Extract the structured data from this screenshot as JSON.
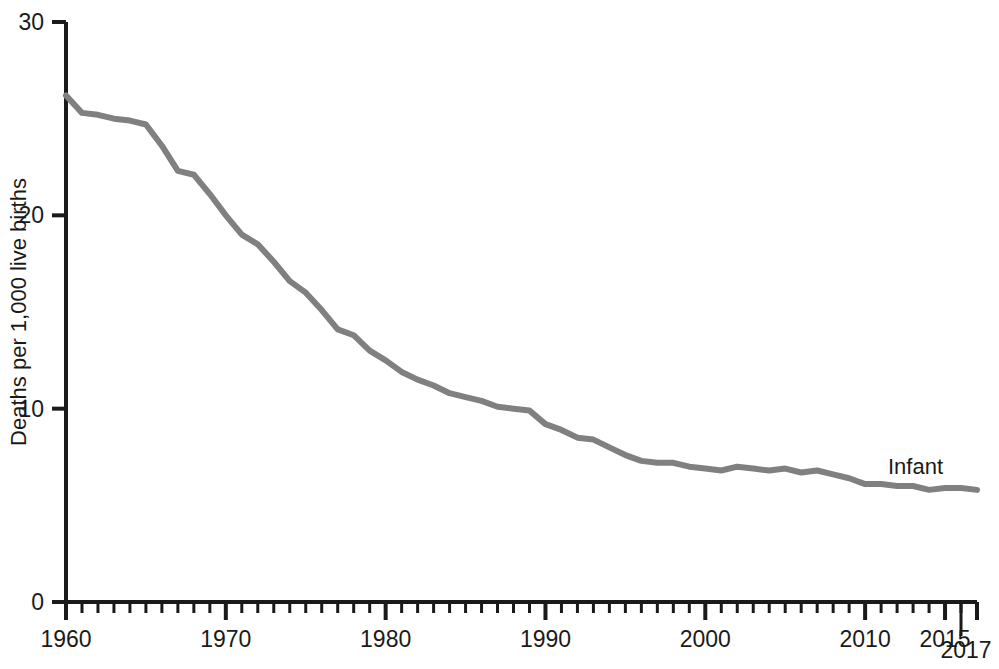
{
  "chart_data": {
    "type": "line",
    "title": "",
    "subtitle": "",
    "xlabel": "",
    "ylabel": "Deaths per 1,000 live births",
    "xlim": [
      1960,
      2017
    ],
    "ylim": [
      0,
      30
    ],
    "grid": false,
    "legend_position": "inline-right-end",
    "y_ticks": [
      0,
      10,
      20,
      30
    ],
    "y_tick_labels": [
      "0",
      "10",
      "20",
      "30"
    ],
    "x_ticks": [
      1960,
      1970,
      1980,
      1990,
      2000,
      2010,
      2015,
      2017
    ],
    "x_tick_labels": [
      "1960",
      "1970",
      "1980",
      "1990",
      "2000",
      "2010",
      "2015",
      "2017"
    ],
    "x_minor_tick_interval": 1,
    "annotations": [
      {
        "text": "2017",
        "kind": "end-year-callout",
        "x": 2017
      }
    ],
    "series": [
      {
        "name": "Infant",
        "label": "Infant",
        "color": "#808080",
        "line_width": 6,
        "x": [
          1960,
          1961,
          1962,
          1963,
          1964,
          1965,
          1966,
          1967,
          1968,
          1969,
          1970,
          1971,
          1972,
          1973,
          1974,
          1975,
          1976,
          1977,
          1978,
          1979,
          1980,
          1981,
          1982,
          1983,
          1984,
          1985,
          1986,
          1987,
          1988,
          1989,
          1990,
          1991,
          1992,
          1993,
          1994,
          1995,
          1996,
          1997,
          1998,
          1999,
          2000,
          2001,
          2002,
          2003,
          2004,
          2005,
          2006,
          2007,
          2008,
          2009,
          2010,
          2011,
          2012,
          2013,
          2014,
          2015,
          2016,
          2017
        ],
        "values": [
          26.2,
          25.3,
          25.2,
          25.0,
          24.9,
          24.7,
          23.6,
          22.3,
          22.1,
          21.1,
          20.0,
          19.0,
          18.5,
          17.6,
          16.6,
          16.0,
          15.1,
          14.1,
          13.8,
          13.0,
          12.5,
          11.9,
          11.5,
          11.2,
          10.8,
          10.6,
          10.4,
          10.1,
          10.0,
          9.9,
          9.2,
          8.9,
          8.5,
          8.4,
          8.0,
          7.6,
          7.3,
          7.2,
          7.2,
          7.0,
          6.9,
          6.8,
          7.0,
          6.9,
          6.8,
          6.9,
          6.7,
          6.8,
          6.6,
          6.4,
          6.1,
          6.1,
          6.0,
          6.0,
          5.8,
          5.9,
          5.9,
          5.8
        ]
      }
    ]
  },
  "axes": {
    "y_axis_title": "Deaths per 1,000 live births"
  }
}
